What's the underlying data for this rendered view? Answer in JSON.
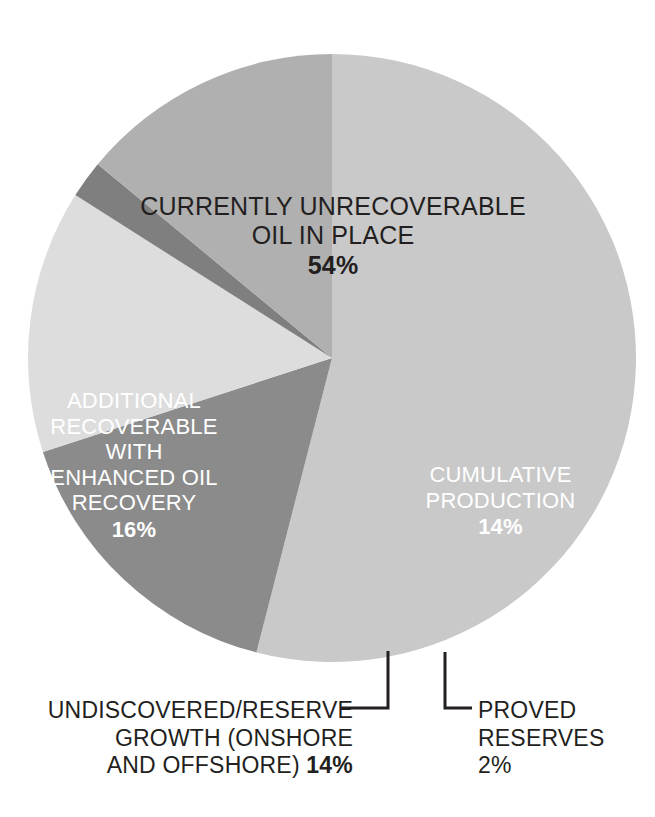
{
  "chart_data": {
    "type": "pie",
    "title": "",
    "subtitle": "",
    "xlabel": "",
    "ylabel": "",
    "legend_position": "none",
    "labels_inside": true,
    "unit": "%",
    "categories": [
      "CURRENTLY UNRECOVERABLE OIL IN PLACE",
      "CUMULATIVE PRODUCTION",
      "PROVED RESERVES",
      "UNDISCOVERED/RESERVE GROWTH (ONSHORE AND OFFSHORE)",
      "ADDITIONAL RECOVERABLE WITH ENHANCED OIL RECOVERY"
    ],
    "values": [
      54,
      14,
      2,
      14,
      16
    ],
    "colors": [
      "#c9c9c9",
      "#b0b0b0",
      "#7f7f7f",
      "#dddddd",
      "#8b8b8b"
    ],
    "slices": [
      {
        "name": "currently-unrecoverable-oil-in-place",
        "label_lines": [
          "CURRENTLY UNRECOVERABLE",
          "OIL IN PLACE"
        ],
        "percent_text": "54%",
        "value": 54,
        "color": "#c9c9c9",
        "label_color": "#231f20",
        "label_placement": "inside"
      },
      {
        "name": "cumulative-production",
        "label_lines": [
          "CUMULATIVE",
          "PRODUCTION"
        ],
        "percent_text": "14%",
        "value": 14,
        "color": "#b0b0b0",
        "label_color": "#ffffff",
        "label_placement": "inside"
      },
      {
        "name": "proved-reserves",
        "label_lines": [
          "PROVED",
          "RESERVES"
        ],
        "percent_text": "2%",
        "value": 2,
        "color": "#7f7f7f",
        "label_color": "#231f20",
        "label_placement": "callout"
      },
      {
        "name": "undiscovered-reserve-growth",
        "label_lines": [
          "UNDISCOVERED/RESERVE",
          "GROWTH (ONSHORE",
          "AND OFFSHORE)"
        ],
        "percent_text": "14%",
        "value": 14,
        "color": "#dddddd",
        "label_color": "#231f20",
        "label_placement": "callout"
      },
      {
        "name": "additional-recoverable-enhanced-oil-recovery",
        "label_lines": [
          "ADDITIONAL",
          "RECOVERABLE",
          "WITH",
          "ENHANCED OIL",
          "RECOVERY"
        ],
        "percent_text": "16%",
        "value": 16,
        "color": "#8b8b8b",
        "label_color": "#ffffff",
        "label_placement": "inside"
      }
    ],
    "background_color": "#ffffff",
    "leader_line_color": "#231f20"
  },
  "labels": {
    "unrecoverable": {
      "line1": "CURRENTLY UNRECOVERABLE",
      "line2": "OIL IN PLACE",
      "percent": "54%"
    },
    "eor": {
      "line1": "ADDITIONAL",
      "line2": "RECOVERABLE",
      "line3": "WITH",
      "line4": "ENHANCED OIL",
      "line5": "RECOVERY",
      "percent": "16%"
    },
    "cumulative": {
      "line1": "CUMULATIVE",
      "line2": "PRODUCTION",
      "percent": "14%"
    },
    "undiscovered": {
      "line1": "UNDISCOVERED/RESERVE",
      "line2": "GROWTH (ONSHORE",
      "line3_text": "AND OFFSHORE) ",
      "line3_percent": "14%"
    },
    "proved": {
      "line1": "PROVED",
      "line2": "RESERVES",
      "percent": "2%"
    }
  }
}
